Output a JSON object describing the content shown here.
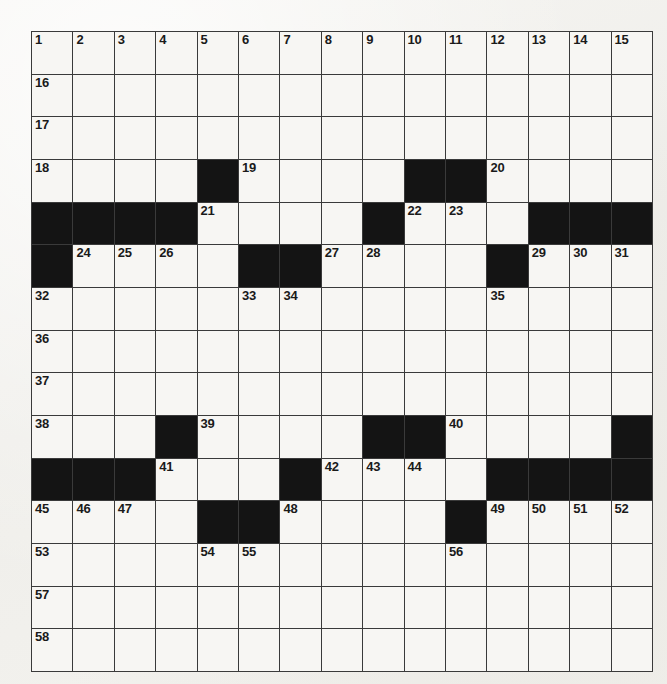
{
  "puzzle": {
    "title": "Crossword Grid",
    "type": "crossword-grid",
    "rows": 15,
    "cols": 15,
    "colors": {
      "page_background": "#f3f2ef",
      "cell_background": "#f7f6f3",
      "block_color": "#141414",
      "grid_line_color": "#3a3a3a",
      "number_color": "#1a1a1a"
    },
    "blocks": [
      [
        3,
        4
      ],
      [
        3,
        9
      ],
      [
        3,
        10
      ],
      [
        4,
        0
      ],
      [
        4,
        1
      ],
      [
        4,
        2
      ],
      [
        4,
        3
      ],
      [
        4,
        8
      ],
      [
        4,
        12
      ],
      [
        4,
        13
      ],
      [
        4,
        14
      ],
      [
        5,
        0
      ],
      [
        5,
        5
      ],
      [
        5,
        6
      ],
      [
        5,
        11
      ],
      [
        9,
        3
      ],
      [
        9,
        8
      ],
      [
        9,
        9
      ],
      [
        9,
        14
      ],
      [
        10,
        0
      ],
      [
        10,
        1
      ],
      [
        10,
        2
      ],
      [
        10,
        6
      ],
      [
        10,
        11
      ],
      [
        10,
        12
      ],
      [
        10,
        13
      ],
      [
        10,
        14
      ],
      [
        11,
        4
      ],
      [
        11,
        5
      ],
      [
        11,
        10
      ]
    ],
    "numbers": [
      {
        "r": 0,
        "c": 0,
        "n": "1"
      },
      {
        "r": 0,
        "c": 1,
        "n": "2"
      },
      {
        "r": 0,
        "c": 2,
        "n": "3"
      },
      {
        "r": 0,
        "c": 3,
        "n": "4"
      },
      {
        "r": 0,
        "c": 4,
        "n": "5"
      },
      {
        "r": 0,
        "c": 5,
        "n": "6"
      },
      {
        "r": 0,
        "c": 6,
        "n": "7"
      },
      {
        "r": 0,
        "c": 7,
        "n": "8"
      },
      {
        "r": 0,
        "c": 8,
        "n": "9"
      },
      {
        "r": 0,
        "c": 9,
        "n": "10"
      },
      {
        "r": 0,
        "c": 10,
        "n": "11"
      },
      {
        "r": 0,
        "c": 11,
        "n": "12"
      },
      {
        "r": 0,
        "c": 12,
        "n": "13"
      },
      {
        "r": 0,
        "c": 13,
        "n": "14"
      },
      {
        "r": 0,
        "c": 14,
        "n": "15"
      },
      {
        "r": 1,
        "c": 0,
        "n": "16"
      },
      {
        "r": 2,
        "c": 0,
        "n": "17"
      },
      {
        "r": 3,
        "c": 0,
        "n": "18"
      },
      {
        "r": 3,
        "c": 5,
        "n": "19"
      },
      {
        "r": 3,
        "c": 11,
        "n": "20"
      },
      {
        "r": 4,
        "c": 4,
        "n": "21"
      },
      {
        "r": 4,
        "c": 9,
        "n": "22"
      },
      {
        "r": 4,
        "c": 10,
        "n": "23"
      },
      {
        "r": 5,
        "c": 1,
        "n": "24"
      },
      {
        "r": 5,
        "c": 2,
        "n": "25"
      },
      {
        "r": 5,
        "c": 3,
        "n": "26"
      },
      {
        "r": 5,
        "c": 7,
        "n": "27"
      },
      {
        "r": 5,
        "c": 8,
        "n": "28"
      },
      {
        "r": 5,
        "c": 12,
        "n": "29"
      },
      {
        "r": 5,
        "c": 13,
        "n": "30"
      },
      {
        "r": 5,
        "c": 14,
        "n": "31"
      },
      {
        "r": 6,
        "c": 0,
        "n": "32"
      },
      {
        "r": 6,
        "c": 5,
        "n": "33"
      },
      {
        "r": 6,
        "c": 6,
        "n": "34"
      },
      {
        "r": 6,
        "c": 11,
        "n": "35"
      },
      {
        "r": 7,
        "c": 0,
        "n": "36"
      },
      {
        "r": 8,
        "c": 0,
        "n": "37"
      },
      {
        "r": 9,
        "c": 0,
        "n": "38"
      },
      {
        "r": 9,
        "c": 4,
        "n": "39"
      },
      {
        "r": 9,
        "c": 10,
        "n": "40"
      },
      {
        "r": 10,
        "c": 3,
        "n": "41"
      },
      {
        "r": 10,
        "c": 7,
        "n": "42"
      },
      {
        "r": 10,
        "c": 8,
        "n": "43"
      },
      {
        "r": 10,
        "c": 9,
        "n": "44"
      },
      {
        "r": 11,
        "c": 0,
        "n": "45"
      },
      {
        "r": 11,
        "c": 1,
        "n": "46"
      },
      {
        "r": 11,
        "c": 2,
        "n": "47"
      },
      {
        "r": 11,
        "c": 6,
        "n": "48"
      },
      {
        "r": 11,
        "c": 11,
        "n": "49"
      },
      {
        "r": 11,
        "c": 12,
        "n": "50"
      },
      {
        "r": 11,
        "c": 13,
        "n": "51"
      },
      {
        "r": 11,
        "c": 14,
        "n": "52"
      },
      {
        "r": 12,
        "c": 0,
        "n": "53"
      },
      {
        "r": 12,
        "c": 4,
        "n": "54"
      },
      {
        "r": 12,
        "c": 5,
        "n": "55"
      },
      {
        "r": 12,
        "c": 10,
        "n": "56"
      },
      {
        "r": 13,
        "c": 0,
        "n": "57"
      },
      {
        "r": 14,
        "c": 0,
        "n": "58"
      }
    ]
  }
}
